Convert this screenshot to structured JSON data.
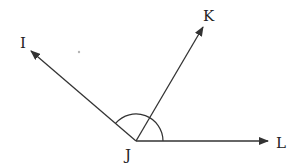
{
  "diagram": {
    "type": "angle-diagram",
    "vertex": {
      "label": "J",
      "x": 136,
      "y": 141
    },
    "rays": [
      {
        "id": "JI",
        "label": "I",
        "tip": {
          "x": 31,
          "y": 51
        },
        "label_pos": {
          "x": 22,
          "y": 48
        }
      },
      {
        "id": "JK",
        "label": "K",
        "tip": {
          "x": 203,
          "y": 27
        },
        "label_pos": {
          "x": 203,
          "y": 20
        }
      },
      {
        "id": "JL",
        "label": "L",
        "tip": {
          "x": 268,
          "y": 141
        },
        "label_pos": {
          "x": 278,
          "y": 147
        }
      }
    ],
    "angle_arc": {
      "center": "J",
      "radius": 27,
      "from": "JL",
      "to": "JI"
    },
    "stray_point": {
      "x": 79,
      "y": 52
    },
    "colors": {
      "stroke": "#333333",
      "text": "#222222",
      "dot": "#b5b5b5",
      "background": "#ffffff"
    }
  }
}
